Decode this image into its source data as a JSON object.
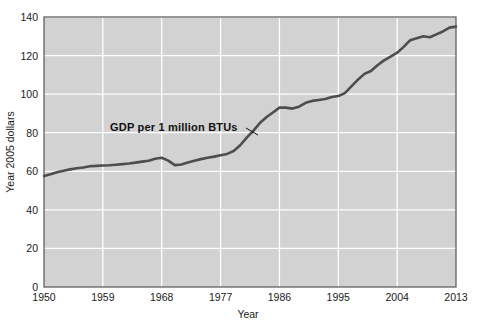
{
  "chart_data": {
    "type": "line",
    "title": "",
    "xlabel": "Year",
    "ylabel": "Year 2005 dollars",
    "xlim": [
      1950,
      2013
    ],
    "ylim": [
      0,
      140
    ],
    "grid": true,
    "legend": "none",
    "xticks": [
      "1950",
      "1959",
      "1968",
      "1977",
      "1986",
      "1995",
      "2004",
      "2013"
    ],
    "yticks": [
      "0",
      "20",
      "40",
      "60",
      "80",
      "100",
      "120",
      "140"
    ],
    "annotations": [
      {
        "text": "GDP per 1 million BTUs",
        "x": 1962,
        "y": 86,
        "points_to_x": 1983,
        "points_to_y": 80
      }
    ],
    "series": [
      {
        "name": "GDP per 1 million BTUs",
        "color": "#4d4d4d",
        "x": [
          1950,
          1951,
          1952,
          1953,
          1954,
          1955,
          1956,
          1957,
          1958,
          1959,
          1960,
          1961,
          1962,
          1963,
          1964,
          1965,
          1966,
          1967,
          1968,
          1969,
          1970,
          1971,
          1972,
          1973,
          1974,
          1975,
          1976,
          1977,
          1978,
          1979,
          1980,
          1981,
          1982,
          1983,
          1984,
          1985,
          1986,
          1987,
          1988,
          1989,
          1990,
          1991,
          1992,
          1993,
          1994,
          1995,
          1996,
          1997,
          1998,
          1999,
          2000,
          2001,
          2002,
          2003,
          2004,
          2005,
          2006,
          2007,
          2008,
          2009,
          2010,
          2011,
          2012,
          2013
        ],
        "values": [
          57.5,
          58.5,
          59.5,
          60.3,
          61.0,
          61.6,
          62.0,
          62.6,
          62.8,
          63.0,
          63.1,
          63.4,
          63.7,
          64.0,
          64.5,
          65.0,
          65.5,
          66.5,
          67.0,
          65.5,
          63.2,
          63.5,
          64.5,
          65.5,
          66.3,
          67.0,
          67.6,
          68.3,
          69.0,
          70.5,
          73.5,
          77.5,
          81.0,
          85.0,
          88.0,
          90.5,
          93.0,
          93.0,
          92.5,
          93.5,
          95.5,
          96.5,
          97.0,
          97.5,
          98.5,
          99.0,
          100.5,
          104.0,
          107.5,
          110.5,
          112.0,
          115.0,
          117.5,
          119.5,
          121.5,
          124.5,
          128.0,
          129.0,
          130.0,
          129.5,
          131.0,
          132.5,
          134.5,
          135.0
        ]
      }
    ]
  },
  "figure": {
    "plot_bg_color": "#d2d2d2",
    "grid_color": "#ffffff",
    "frame_color": "#555555"
  }
}
